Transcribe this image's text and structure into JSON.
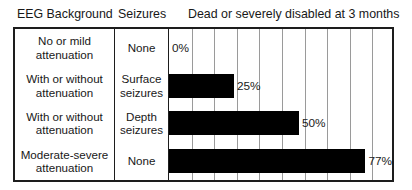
{
  "header": {
    "col_eeg_label": "EEG Background",
    "col_seizures_label": "Seizures",
    "col_outcome_label": "Dead or severely disabled at 3 months"
  },
  "rows": [
    {
      "eeg_background": "No or mild attenuation",
      "eeg_background_line1": "No or mild",
      "eeg_background_line2": "attenuation",
      "seizures": "None",
      "seizures_line1": "None",
      "seizures_line2": "",
      "value_label": "0%"
    },
    {
      "eeg_background": "With or without attenuation",
      "eeg_background_line1": "With or without",
      "eeg_background_line2": "attenuation",
      "seizures": "Surface seizures",
      "seizures_line1": "Surface",
      "seizures_line2": "seizures",
      "value_label": "25%"
    },
    {
      "eeg_background": "With or without attenuation",
      "eeg_background_line1": "With or without",
      "eeg_background_line2": "attenuation",
      "seizures": "Depth seizures",
      "seizures_line1": "Depth",
      "seizures_line2": "seizures",
      "value_label": "50%"
    },
    {
      "eeg_background": "Moderate-severe attenuation",
      "eeg_background_line1": "Moderate-severe",
      "eeg_background_line2": "attenuation",
      "seizures": "None",
      "seizures_line1": "None",
      "seizures_line2": "",
      "value_label": "77%"
    }
  ],
  "chart_data": {
    "type": "bar",
    "orientation": "horizontal",
    "title": "Dead or severely disabled at 3 months",
    "xlabel": "",
    "ylabel": "",
    "xlim": [
      0,
      87
    ],
    "grid": true,
    "grid_axis": "x",
    "grid_interval": 8.7,
    "gridline_count": 9,
    "legend": "none",
    "bar_color": "#000000",
    "categories": [
      "No or mild attenuation / None",
      "With or without attenuation / Surface seizures",
      "With or without attenuation / Depth seizures",
      "Moderate-severe attenuation / None"
    ],
    "values": [
      0,
      25,
      50,
      77
    ],
    "data_labels": [
      "0%",
      "25%",
      "50%",
      "77%"
    ]
  },
  "style": {
    "border_color": "#1d1d1d",
    "gridline_color": "#9a9a9a",
    "text_color": "#181818",
    "background": "#ffffff"
  }
}
